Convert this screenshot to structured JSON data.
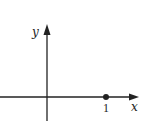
{
  "diagram": {
    "type": "coordinate-axes",
    "axes": {
      "x_label": "x",
      "y_label": "y"
    },
    "points": [
      {
        "label": "1",
        "x_value": 1
      }
    ],
    "colors": {
      "stroke": "#222222",
      "background": "#ffffff"
    }
  }
}
